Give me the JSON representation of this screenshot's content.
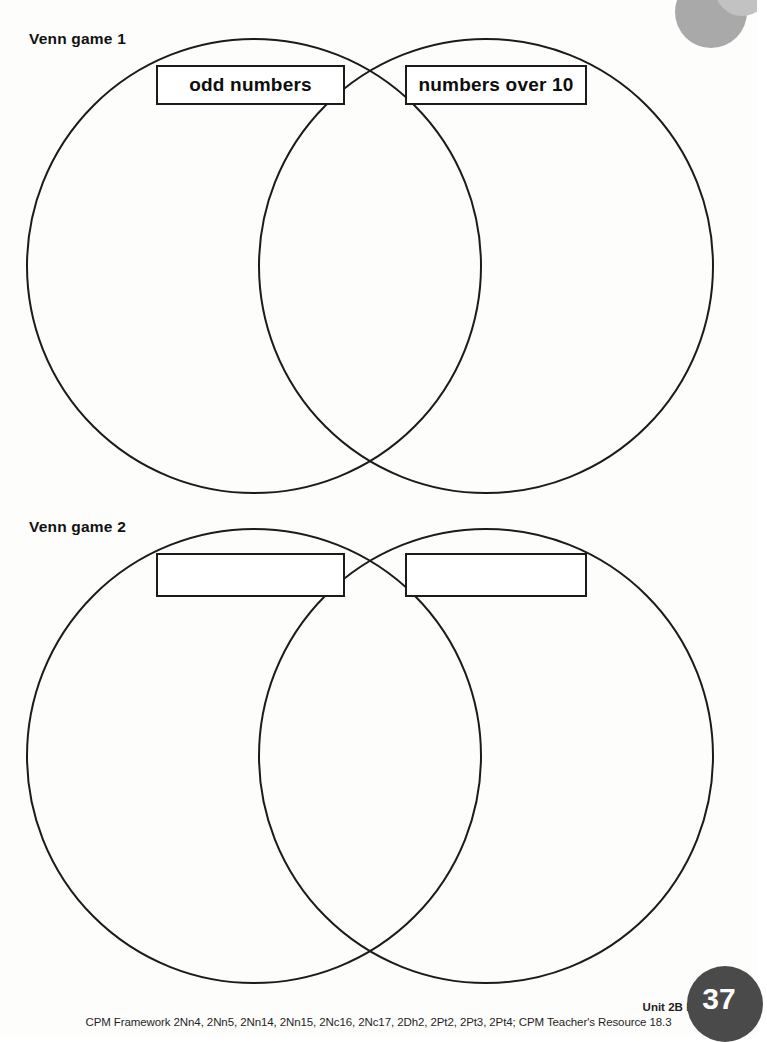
{
  "page": {
    "number": "37",
    "background_color": "#fdfdfc",
    "ink_color": "#1a1a1a"
  },
  "decoration": {
    "corner_blob_large_color": "#a9a9a9",
    "corner_blob_small_color": "#c2c2c2",
    "badge_color": "#4a4a4a"
  },
  "sections": [
    {
      "title": "Venn game 1",
      "left_label": "odd numbers",
      "right_label": "numbers over 10"
    },
    {
      "title": "Venn game 2",
      "left_label": "",
      "right_label": ""
    }
  ],
  "footer": {
    "unit_strong": "Unit 2B",
    "unit_rest": " Handling data",
    "framework": "CPM Framework 2Nn4, 2Nn5, 2Nn14, 2Nn15, 2Nc16, 2Nc17, 2Dh2, 2Pt2, 2Pt3, 2Pt4; CPM Teacher's Resource 18.3"
  }
}
